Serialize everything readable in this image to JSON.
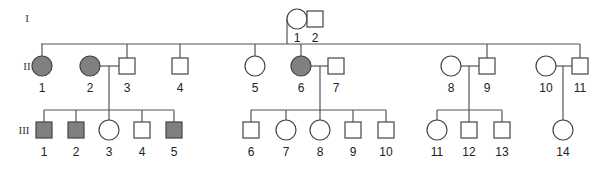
{
  "colors": {
    "affected": "#808080",
    "unaffected": "#ffffff",
    "line": "#555555"
  },
  "generations": [
    {
      "label": "I",
      "y": 22
    },
    {
      "label": "II",
      "y": 66
    },
    {
      "label": "III",
      "y": 130
    }
  ],
  "individuals": [
    {
      "id": "I-1",
      "label": "1",
      "sex": "female",
      "affected": false,
      "x": 297,
      "y": 19
    },
    {
      "id": "I-2",
      "label": "2",
      "sex": "male",
      "affected": false,
      "x": 315,
      "y": 19
    },
    {
      "id": "II-1",
      "label": "1",
      "sex": "female",
      "affected": true,
      "x": 42,
      "y": 66
    },
    {
      "id": "II-2",
      "label": "2",
      "sex": "female",
      "affected": true,
      "x": 90,
      "y": 66
    },
    {
      "id": "II-3",
      "label": "3",
      "sex": "male",
      "affected": false,
      "x": 127,
      "y": 66
    },
    {
      "id": "II-4",
      "label": "4",
      "sex": "male",
      "affected": false,
      "x": 180,
      "y": 66
    },
    {
      "id": "II-5",
      "label": "5",
      "sex": "female",
      "affected": false,
      "x": 255,
      "y": 66
    },
    {
      "id": "II-6",
      "label": "6",
      "sex": "female",
      "affected": true,
      "x": 301,
      "y": 66
    },
    {
      "id": "II-7",
      "label": "7",
      "sex": "male",
      "affected": false,
      "x": 336,
      "y": 66
    },
    {
      "id": "II-8",
      "label": "8",
      "sex": "female",
      "affected": false,
      "x": 451,
      "y": 66
    },
    {
      "id": "II-9",
      "label": "9",
      "sex": "male",
      "affected": false,
      "x": 487,
      "y": 66
    },
    {
      "id": "II-10",
      "label": "10",
      "sex": "female",
      "affected": false,
      "x": 546,
      "y": 66
    },
    {
      "id": "II-11",
      "label": "11",
      "sex": "male",
      "affected": false,
      "x": 580,
      "y": 66
    },
    {
      "id": "III-1",
      "label": "1",
      "sex": "male",
      "affected": true,
      "x": 44,
      "y": 130
    },
    {
      "id": "III-2",
      "label": "2",
      "sex": "male",
      "affected": true,
      "x": 76,
      "y": 130
    },
    {
      "id": "III-3",
      "label": "3",
      "sex": "female",
      "affected": false,
      "x": 109,
      "y": 130
    },
    {
      "id": "III-4",
      "label": "4",
      "sex": "male",
      "affected": false,
      "x": 142,
      "y": 130
    },
    {
      "id": "III-5",
      "label": "5",
      "sex": "male",
      "affected": true,
      "x": 174,
      "y": 130
    },
    {
      "id": "III-6",
      "label": "6",
      "sex": "male",
      "affected": false,
      "x": 251,
      "y": 130
    },
    {
      "id": "III-7",
      "label": "7",
      "sex": "female",
      "affected": false,
      "x": 286,
      "y": 130
    },
    {
      "id": "III-8",
      "label": "8",
      "sex": "female",
      "affected": false,
      "x": 320,
      "y": 130
    },
    {
      "id": "III-9",
      "label": "9",
      "sex": "male",
      "affected": false,
      "x": 353,
      "y": 130
    },
    {
      "id": "III-10",
      "label": "10",
      "sex": "male",
      "affected": false,
      "x": 386,
      "y": 130
    },
    {
      "id": "III-11",
      "label": "11",
      "sex": "female",
      "affected": false,
      "x": 437,
      "y": 130
    },
    {
      "id": "III-12",
      "label": "12",
      "sex": "male",
      "affected": false,
      "x": 469,
      "y": 130
    },
    {
      "id": "III-13",
      "label": "13",
      "sex": "male",
      "affected": false,
      "x": 502,
      "y": 130
    },
    {
      "id": "III-14",
      "label": "14",
      "sex": "female",
      "affected": false,
      "x": 563,
      "y": 130
    }
  ]
}
